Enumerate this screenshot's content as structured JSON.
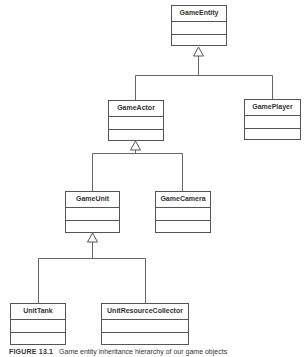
{
  "diagram": {
    "type": "uml-class-inheritance",
    "classes": [
      {
        "id": "GameEntity",
        "name": "GameEntity"
      },
      {
        "id": "GameActor",
        "name": "GameActor"
      },
      {
        "id": "GamePlayer",
        "name": "GamePlayer"
      },
      {
        "id": "GameUnit",
        "name": "GameUnit"
      },
      {
        "id": "GameCamera",
        "name": "GameCamera"
      },
      {
        "id": "UnitTank",
        "name": "UnitTank"
      },
      {
        "id": "UnitResourceCollector",
        "name": "UnitResourceCollector"
      }
    ],
    "inheritance": [
      {
        "child": "GameActor",
        "parent": "GameEntity"
      },
      {
        "child": "GamePlayer",
        "parent": "GameEntity"
      },
      {
        "child": "GameUnit",
        "parent": "GameActor"
      },
      {
        "child": "GameCamera",
        "parent": "GameActor"
      },
      {
        "child": "UnitTank",
        "parent": "GameUnit"
      },
      {
        "child": "UnitResourceCollector",
        "parent": "GameUnit"
      }
    ]
  },
  "caption": {
    "label": "FIGURE 13.1",
    "text": "Game entity inheritance hierarchy of our game objects"
  },
  "colors": {
    "line": "#555555",
    "text": "#333333",
    "background": "#ffffff"
  }
}
